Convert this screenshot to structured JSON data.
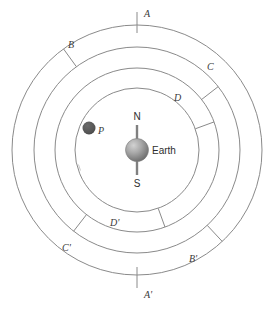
{
  "figure": {
    "background_color": "#ffffff",
    "ring_color": "#8a8a8a",
    "center": {
      "x": 137,
      "y": 150
    }
  },
  "earth": {
    "label": "Earth",
    "north_label": "N",
    "south_label": "S",
    "radius": 11,
    "fill_light": "#c7c7c7",
    "fill_dark": "#6e6e6e",
    "axis_color": "#808080"
  },
  "planet": {
    "label": "P",
    "radius": 6,
    "fill": "#555555",
    "x": 89,
    "y": 128
  },
  "rings": [
    {
      "name": "ring-outer",
      "radius": 125
    },
    {
      "name": "ring-second",
      "radius": 103
    },
    {
      "name": "ring-third",
      "radius": 82
    },
    {
      "name": "ring-inner",
      "radius": 62
    }
  ],
  "tick_labels": {
    "upper": [
      "A",
      "B",
      "C",
      "D"
    ],
    "lower": [
      "A'",
      "B'",
      "C'",
      "D'"
    ]
  },
  "markers": [
    {
      "id": "marker-a",
      "label": "A",
      "angle_deg": -90,
      "r_inner": 117,
      "r_outer": 138,
      "label_dx": 6,
      "label_dy": -2
    },
    {
      "id": "marker-b",
      "label": "B",
      "angle_deg": -126,
      "r_inner": 103,
      "r_outer": 125,
      "label_dx": 7,
      "label_dy": 1
    },
    {
      "id": "marker-c",
      "label": "C",
      "angle_deg": -38,
      "r_inner": 82,
      "r_outer": 103,
      "label_dx": 4,
      "label_dy": -3
    },
    {
      "id": "marker-d",
      "label": "D",
      "angle_deg": -20,
      "r_inner": 62,
      "r_outer": 82,
      "label_dx": 2,
      "label_dy": -4
    },
    {
      "id": "marker-dp",
      "label": "D'",
      "angle_deg": 70,
      "r_inner": 62,
      "r_outer": 82,
      "label_dx": 5,
      "label_dy": 2
    },
    {
      "id": "marker-cp",
      "label": "C'",
      "angle_deg": 128,
      "r_inner": 82,
      "r_outer": 103,
      "label_dx": -11,
      "label_dy": 7
    },
    {
      "id": "marker-bp",
      "label": "B'",
      "angle_deg": 47,
      "r_inner": 103,
      "r_outer": 125,
      "label_dx": 6,
      "label_dy": 5
    },
    {
      "id": "marker-ap",
      "label": "A'",
      "angle_deg": 90,
      "r_inner": 117,
      "r_outer": 138,
      "label_dx": 6,
      "label_dy": 5
    }
  ]
}
